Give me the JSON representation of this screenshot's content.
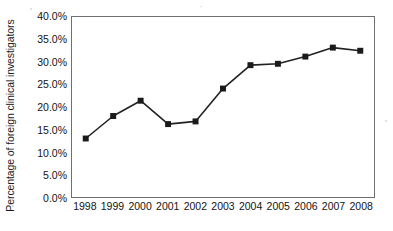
{
  "chart_data": {
    "type": "line",
    "title": "",
    "xlabel": "",
    "ylabel": "Percentage of foreign clinical investigators",
    "categories": [
      "1998",
      "1999",
      "2000",
      "2001",
      "2002",
      "2003",
      "2004",
      "2005",
      "2006",
      "2007",
      "2008"
    ],
    "values": [
      13.0,
      18.0,
      21.4,
      16.2,
      16.8,
      24.1,
      29.3,
      29.6,
      31.2,
      33.2,
      32.5
    ],
    "series": [
      {
        "name": "Percentage of foreign clinical investigators",
        "values": [
          13.0,
          18.0,
          21.4,
          16.2,
          16.8,
          24.1,
          29.3,
          29.6,
          31.2,
          33.2,
          32.5
        ]
      }
    ],
    "ylim": [
      0,
      40
    ],
    "ytick_values": [
      0,
      5,
      10,
      15,
      20,
      25,
      30,
      35,
      40
    ],
    "ytick_labels": [
      "0.0%",
      "5.0%",
      "10.0%",
      "15.0%",
      "20.0%",
      "25.0%",
      "30.0%",
      "35.0%",
      "40.0%"
    ],
    "grid": false,
    "legend": "none",
    "marker": "square",
    "line_color": "#222222",
    "marker_color": "#1a1a1a",
    "frame_color": "#6f6f6f",
    "background": "#ffffff"
  }
}
